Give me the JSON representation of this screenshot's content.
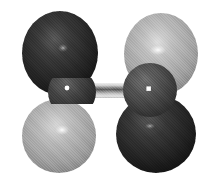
{
  "figure": {
    "title": "Pi antibonding molecular orbital",
    "width": 215,
    "height": 183,
    "background_color": "#ffffff",
    "render_style": "dithered shaded 3D isosurface",
    "caption": ""
  },
  "palette": {
    "background": "#ffffff",
    "lobe_positive": "#a9a9a9",
    "lobe_positive_light": "#c8c8c8",
    "lobe_positive_dark": "#7d7d7d",
    "lobe_negative": "#2b2b2b",
    "lobe_negative_light": "#4a4a4a",
    "lobe_negative_dark": "#111111",
    "atom_left": "#3a3a3a",
    "atom_right": "#4a4a4a",
    "bond_light": "#d8d8d8",
    "bond_mid": "#9a9a9a",
    "bond_dark": "#555555",
    "specular": "#ffffff"
  },
  "scene": {
    "atoms": [
      {
        "name": "atom-left",
        "label": "",
        "cx": 72,
        "cy": 92,
        "r": 22,
        "phase_color": "#3a3a3a",
        "specular": {
          "x": 67,
          "y": 88,
          "r": 2.2
        }
      },
      {
        "name": "atom-right",
        "label": "",
        "cx": 150,
        "cy": 90,
        "r": 27,
        "phase_color": "#4a4a4a",
        "specular": {
          "x": 149,
          "y": 89,
          "r": 2.6
        }
      }
    ],
    "bond": {
      "name": "bond-cylinder",
      "x1": 92,
      "y1": 91,
      "x2": 132,
      "y2": 90,
      "thickness": 14,
      "bands": [
        "#e2e2e2",
        "#b4b4b4",
        "#6e6e6e",
        "#b4b4b4",
        "#e2e2e2"
      ]
    },
    "lobes": [
      {
        "name": "lobe-top-left",
        "sign": "negative",
        "cx": 60,
        "cy": 53,
        "rx": 38,
        "ry": 42,
        "fill": "#2b2b2b",
        "highlight": "#4f4f4f",
        "shadow": "#0e0e0e",
        "specular": {
          "x": 63,
          "y": 48,
          "r": 4
        }
      },
      {
        "name": "lobe-top-right",
        "sign": "positive",
        "cx": 161,
        "cy": 54,
        "rx": 37,
        "ry": 41,
        "fill": "#a9a9a9",
        "highlight": "#d4d4d4",
        "shadow": "#6f6f6f",
        "specular": {
          "x": 158,
          "y": 50,
          "r": 5
        }
      },
      {
        "name": "lobe-bottom-left",
        "sign": "positive",
        "cx": 59,
        "cy": 136,
        "rx": 37,
        "ry": 37,
        "fill": "#a9a9a9",
        "highlight": "#d2d2d2",
        "shadow": "#6d6d6d",
        "specular": {
          "x": 62,
          "y": 130,
          "r": 5
        }
      },
      {
        "name": "lobe-bottom-right",
        "sign": "negative",
        "cx": 156,
        "cy": 134,
        "rx": 40,
        "ry": 39,
        "fill": "#2b2b2b",
        "highlight": "#4c4c4c",
        "shadow": "#0d0d0d",
        "specular": {
          "x": 150,
          "y": 126,
          "r": 3
        }
      }
    ]
  },
  "legend": {
    "visible": false,
    "entries": [
      {
        "label": "",
        "swatch": "#2b2b2b"
      },
      {
        "label": "",
        "swatch": "#a9a9a9"
      }
    ]
  }
}
